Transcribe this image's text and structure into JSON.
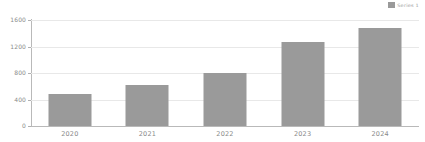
{
  "chart_data": {
    "type": "bar",
    "title": "",
    "subtitle": "",
    "xlabel": "",
    "ylabel": "",
    "categories": [
      "2020",
      "2021",
      "2022",
      "2023",
      "2024"
    ],
    "values": [
      490,
      620,
      800,
      1265,
      1480
    ],
    "series": [
      {
        "name": "Series 1",
        "values": [
          490,
          620,
          800,
          1265,
          1480
        ],
        "color": "#9a9a9a"
      }
    ],
    "ylim": [
      0,
      1600
    ],
    "yticks": [
      0,
      400,
      800,
      1200,
      1600
    ],
    "ytick_labels": [
      "0",
      "400",
      "800",
      "1200",
      "1600"
    ],
    "grid": true,
    "legend_position": "top-right",
    "legend_entries": [
      {
        "label": "Series 1",
        "color": "#9a9a9a"
      }
    ]
  },
  "legend": {
    "label": "Series 1"
  },
  "colors": {
    "bar": "#9a9a9a",
    "gridline": "#e8e8e8",
    "axis": "#b9b9b9",
    "tick_text": "#8a8a8a",
    "background": "#ffffff"
  }
}
